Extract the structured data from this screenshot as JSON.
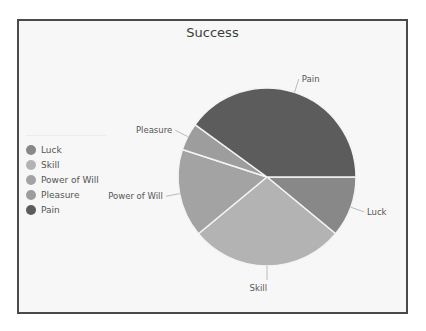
{
  "chart_data": {
    "type": "pie",
    "title": "Success",
    "categories": [
      "Luck",
      "Skill",
      "Power of Will",
      "Pleasure",
      "Pain"
    ],
    "values": [
      11,
      28,
      16,
      5,
      40
    ],
    "unit": "percent (estimated from slice angles)",
    "start_angle": "3 o'clock, clockwise",
    "colors": [
      "#888888",
      "#b3b3b3",
      "#a3a3a3",
      "#9d9d9d",
      "#5c5c5c"
    ],
    "legend": {
      "position": "left",
      "entries": [
        "Luck",
        "Skill",
        "Power of Will",
        "Pleasure",
        "Pain"
      ]
    },
    "slice_labels": [
      "Luck",
      "Skill",
      "Power of Will",
      "Pleasure",
      "Pain"
    ]
  }
}
